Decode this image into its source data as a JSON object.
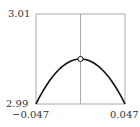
{
  "chart_data": {
    "type": "line",
    "title": "",
    "xlabel": "",
    "ylabel": "",
    "xlim": [
      -0.047,
      0.047
    ],
    "ylim": [
      2.99,
      3.01
    ],
    "x_tick_labels": [
      "−0.047",
      "0.047"
    ],
    "y_tick_labels": [
      "2.99",
      "3.01"
    ],
    "grid": false,
    "vertical_reference_line_x": 0,
    "series": [
      {
        "name": "curve",
        "x": [
          -0.047,
          -0.035,
          -0.0235,
          -0.012,
          0,
          0.012,
          0.0235,
          0.035,
          0.047
        ],
        "y": [
          2.99,
          2.9944,
          2.9975,
          2.9993,
          3.0,
          2.9993,
          2.9975,
          2.9944,
          2.99
        ]
      }
    ],
    "markers": [
      {
        "x": 0,
        "y": 3.0,
        "style": "open-circle"
      }
    ]
  },
  "labels": {
    "ymax": "3.01",
    "ymin": "2.99",
    "xmin": "−0.047",
    "xmax": "0.047"
  }
}
